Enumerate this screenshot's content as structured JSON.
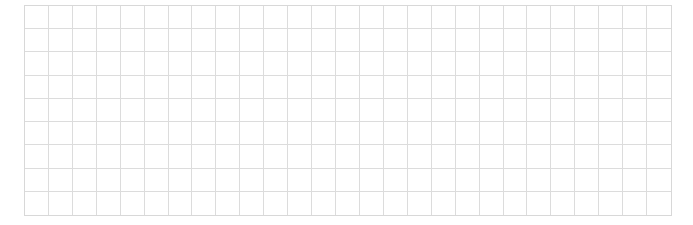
{
  "grid": {
    "columns": 27,
    "rows": 9,
    "cell_width_px": 24,
    "cell_height_px": 23.4,
    "line_color": "#dcdcdc",
    "background_color": "#ffffff"
  }
}
